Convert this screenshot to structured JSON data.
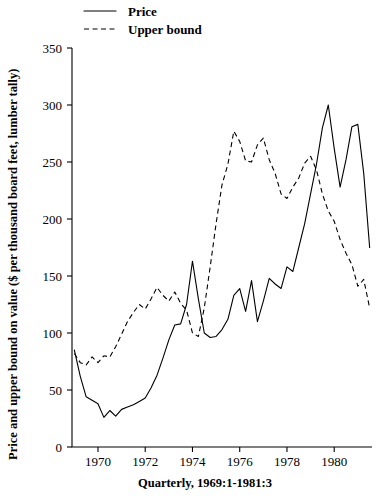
{
  "chart_data": {
    "type": "line",
    "title": "",
    "xlabel": "Quarterly, 1969:1-1981:3",
    "ylabel": "Price and upper bound on value ($ per thousand board feet, lumber tally)",
    "xlim": [
      1968.9,
      1981.6
    ],
    "ylim": [
      0,
      350
    ],
    "grid": false,
    "legend_position": "top-left-above-plot",
    "y_ticks": [
      0,
      50,
      100,
      150,
      200,
      250,
      300,
      350
    ],
    "y_tick_labels": [
      "0",
      "50",
      "100",
      "150",
      "200",
      "250",
      "300",
      "350"
    ],
    "x_ticks": [
      1970,
      1972,
      1974,
      1976,
      1978,
      1980
    ],
    "x_tick_labels": [
      "1970",
      "1972",
      "1974",
      "1976",
      "1978",
      "1980"
    ],
    "x": [
      1969.0,
      1969.25,
      1969.5,
      1969.75,
      1970.0,
      1970.25,
      1970.5,
      1970.75,
      1971.0,
      1971.25,
      1971.5,
      1971.75,
      1972.0,
      1972.25,
      1972.5,
      1972.75,
      1973.0,
      1973.25,
      1973.5,
      1973.75,
      1974.0,
      1974.25,
      1974.5,
      1974.75,
      1975.0,
      1975.25,
      1975.5,
      1975.75,
      1976.0,
      1976.25,
      1976.5,
      1976.75,
      1977.0,
      1977.25,
      1977.5,
      1977.75,
      1978.0,
      1978.25,
      1978.5,
      1978.75,
      1979.0,
      1979.25,
      1979.5,
      1979.75,
      1980.0,
      1980.25,
      1980.5,
      1980.75,
      1981.0,
      1981.25,
      1981.5
    ],
    "series": [
      {
        "name": "Price",
        "style": "solid",
        "values": [
          85,
          62,
          44,
          41,
          38,
          26,
          32,
          27,
          33,
          35,
          37,
          40,
          43,
          52,
          63,
          78,
          94,
          107,
          108,
          125,
          163,
          130,
          100,
          96,
          97,
          103,
          112,
          133,
          139,
          119,
          146,
          110,
          128,
          148,
          143,
          139,
          158,
          154,
          175,
          196,
          222,
          248,
          280,
          300,
          262,
          228,
          252,
          281,
          283,
          240,
          175
        ]
      },
      {
        "name": "Upper bound",
        "style": "dashed",
        "values": [
          82,
          74,
          72,
          79,
          74,
          80,
          79,
          88,
          99,
          110,
          118,
          125,
          121,
          130,
          140,
          133,
          128,
          136,
          126,
          120,
          100,
          97,
          122,
          158,
          196,
          230,
          248,
          277,
          268,
          251,
          250,
          265,
          271,
          252,
          240,
          222,
          218,
          228,
          236,
          249,
          255,
          243,
          222,
          207,
          198,
          182,
          170,
          160,
          141,
          147,
          122
        ]
      }
    ]
  },
  "legend": {
    "entries": [
      {
        "label": "Price",
        "style": "solid"
      },
      {
        "label": "Upper bound",
        "style": "dashed"
      }
    ]
  }
}
